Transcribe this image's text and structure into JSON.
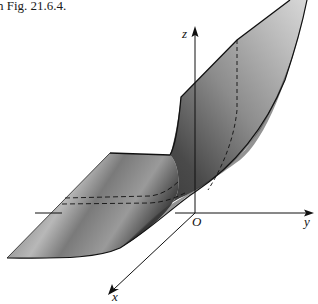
{
  "caption": "n Fig. 21.6.4.",
  "figure": {
    "axes": {
      "x_label": "x",
      "y_label": "y",
      "z_label": "z",
      "origin_label": "O"
    },
    "colors": {
      "surface_dark": "#2a2a2a",
      "surface_mid": "#6e6e6e",
      "surface_light": "#b5b5b5",
      "axis": "#111111"
    }
  }
}
